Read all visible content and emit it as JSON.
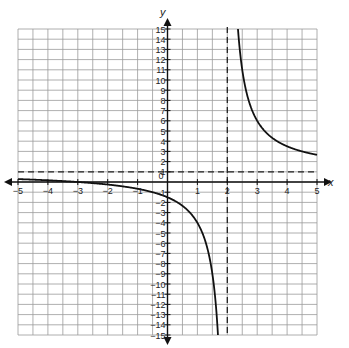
{
  "chart_data": {
    "type": "line",
    "title": "",
    "xlabel": "x",
    "ylabel": "y",
    "xlim": [
      -5,
      5
    ],
    "ylim": [
      -15,
      15
    ],
    "grid": true,
    "grid_x_step": 0.5,
    "grid_y_step": 1,
    "x_ticks": [
      -5,
      -4,
      -3,
      -2,
      -1,
      0,
      1,
      2,
      3,
      4,
      5
    ],
    "x_tick_labels": [
      "−5",
      "−4",
      "−3",
      "−2",
      "−1",
      "0",
      "1",
      "2",
      "3",
      "4",
      "5"
    ],
    "y_ticks": [
      15,
      14,
      13,
      12,
      11,
      10,
      9,
      8,
      7,
      6,
      5,
      4,
      3,
      2,
      1,
      -1,
      -2,
      -3,
      -4,
      -5,
      -6,
      -7,
      -8,
      -9,
      -10,
      -11,
      -12,
      -13,
      -14,
      -15
    ],
    "y_tick_labels": [
      "15",
      "14",
      "13",
      "12",
      "11",
      "10",
      "9",
      "8",
      "7",
      "6",
      "5",
      "4",
      "3",
      "2",
      "1",
      "−1",
      "−2",
      "−3",
      "−4",
      "−5",
      "−6",
      "−7",
      "−8",
      "−9",
      "−10",
      "−11",
      "−12",
      "−13",
      "−14",
      "−15"
    ],
    "function": "y = 5/(x - 2) + 1",
    "series": [
      {
        "name": "left branch",
        "x": [
          -5,
          -4,
          -3,
          -2,
          -1,
          0,
          0.5,
          1,
          1.5,
          1.75,
          1.7
        ],
        "y": [
          0.29,
          0.17,
          0,
          -0.25,
          -0.67,
          -1.5,
          -2.33,
          -4,
          -9,
          -19,
          -15.67
        ]
      },
      {
        "name": "right branch",
        "x": [
          2.25,
          2.5,
          3,
          3.5,
          4,
          4.5,
          5
        ],
        "y": [
          21,
          11,
          6,
          4.33,
          3.5,
          3,
          2.67
        ]
      }
    ],
    "asymptotes": [
      {
        "type": "vertical",
        "value": 2,
        "style": "dashed"
      },
      {
        "type": "horizontal",
        "value": 1,
        "style": "dashed"
      }
    ],
    "colors": {
      "grid": "#9a9a9a",
      "axis": "#111111",
      "curve": "#111111",
      "asymptote": "#222222"
    }
  }
}
